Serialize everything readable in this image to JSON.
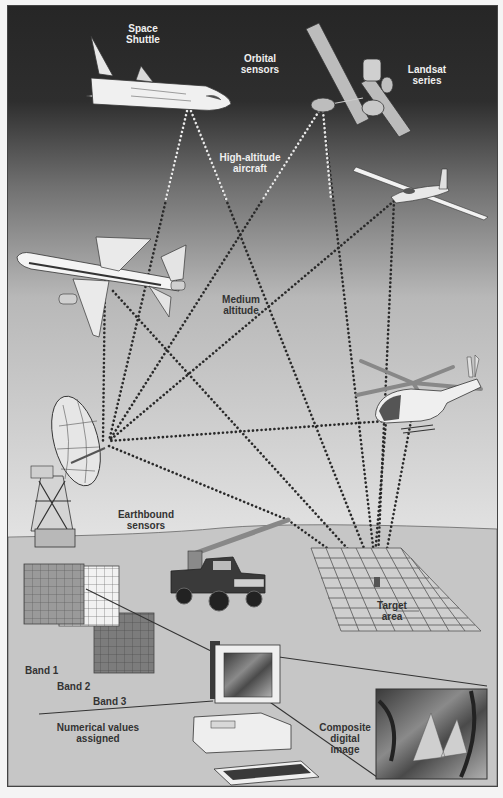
{
  "figure": {
    "colors": {
      "sky_top": "#2a2a2a",
      "sky_mid": "#7a7a7a",
      "sky_low": "#dcdcdc",
      "ground": "#c4c4c4",
      "border": "#444444",
      "label_light": "#f0f0f0",
      "label_dark": "#333333"
    },
    "labels": {
      "space_shuttle": "Space\nShuttle",
      "orbital_sensors": "Orbital\nsensors",
      "landsat": "Landsat\nseries",
      "high_altitude": "High-altitude\naircraft",
      "medium_altitude": "Medium\naltitude",
      "earthbound": "Earthbound\nsensors",
      "target_area": "Target\narea",
      "band_1": "Band 1",
      "band_2": "Band 2",
      "band_3": "Band 3",
      "numerical_values": "Numerical values\nassigned",
      "composite_image": "Composite\ndigital\nimage"
    },
    "platforms": [
      {
        "name": "Space Shuttle",
        "tier": "Orbital"
      },
      {
        "name": "Landsat satellite",
        "tier": "Orbital"
      },
      {
        "name": "Glider / high-altitude aircraft",
        "tier": "High-altitude"
      },
      {
        "name": "Airliner",
        "tier": "Medium altitude"
      },
      {
        "name": "Helicopter",
        "tier": "Medium altitude"
      },
      {
        "name": "Radio dish antenna",
        "tier": "Earthbound"
      },
      {
        "name": "Boom truck",
        "tier": "Earthbound"
      }
    ],
    "bands": [
      "Band 1",
      "Band 2",
      "Band 3"
    ]
  }
}
